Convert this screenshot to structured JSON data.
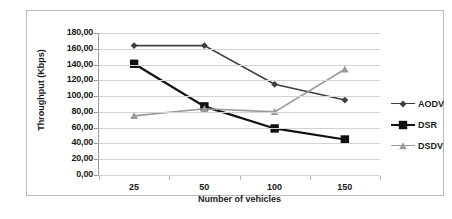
{
  "chart_data": {
    "type": "line",
    "title": "",
    "xlabel": "Number of vehicles",
    "ylabel": "Throughput (Kbps)",
    "categories": [
      "25",
      "50",
      "100",
      "150"
    ],
    "xtick_labels": [
      "25",
      "50",
      "100",
      "150"
    ],
    "ytick_labels": [
      "180,00",
      "160,00",
      "140,00",
      "120,00",
      "100,00",
      "80,00",
      "60,00",
      "40,00",
      "20,00",
      "0,00"
    ],
    "ytick_values": [
      180,
      160,
      140,
      120,
      100,
      80,
      60,
      40,
      20,
      0
    ],
    "ylim": [
      0,
      180
    ],
    "grid": true,
    "legend_position": "right",
    "series": [
      {
        "name": "AODV",
        "marker": "diamond",
        "color": "#3f3f3f",
        "values": [
          164,
          164,
          115,
          95
        ]
      },
      {
        "name": "DSR",
        "marker": "square",
        "color": "#111111",
        "values": [
          141,
          87,
          59,
          45
        ]
      },
      {
        "name": "DSDV",
        "marker": "triangle",
        "color": "#9a9a9a",
        "values": [
          75,
          84,
          80,
          134
        ]
      }
    ]
  },
  "legend": {
    "items": [
      {
        "label": "AODV"
      },
      {
        "label": "DSR"
      },
      {
        "label": "DSDV"
      }
    ]
  }
}
